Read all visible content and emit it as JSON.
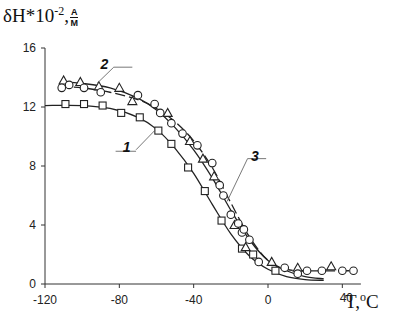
{
  "chart_data": {
    "type": "scatter",
    "title": "",
    "ylabel": "δH*10^-2, A/M",
    "xlabel": "T, °C",
    "ylabel_parts": {
      "main": "δH*10",
      "exp": "-2",
      "sep": ",",
      "num": "A",
      "den": "M"
    },
    "xlabel_parts": {
      "main": "T,",
      "exp": "o",
      "unit": "C"
    },
    "xlim": [
      -120,
      50
    ],
    "ylim": [
      0,
      16
    ],
    "x_ticks": [
      -120,
      -80,
      -40,
      0,
      40
    ],
    "y_ticks": [
      0,
      4,
      8,
      12,
      16
    ],
    "x_tick_labels": [
      "-120",
      "-80",
      "-40",
      "0",
      "40"
    ],
    "y_tick_labels": [
      "0",
      "4",
      "8",
      "12",
      "16"
    ],
    "grid": false,
    "legend": "curve number labels with leader lines",
    "series": [
      {
        "name": "1",
        "marker": "square",
        "line": "solid",
        "points": [
          [
            -109,
            12.2
          ],
          [
            -99,
            12.2
          ],
          [
            -89,
            12.1
          ],
          [
            -79,
            11.6
          ],
          [
            -69,
            11.3
          ],
          [
            -59,
            10.4
          ],
          [
            -52,
            9.5
          ],
          [
            -43,
            7.9
          ],
          [
            -34,
            6.3
          ],
          [
            -25,
            4.3
          ],
          [
            -14,
            2.4
          ],
          [
            -8,
            2.0
          ],
          [
            4,
            0.9
          ]
        ],
        "fit": [
          [
            -120,
            12.1
          ],
          [
            -100,
            12.1
          ],
          [
            -85,
            11.9
          ],
          [
            -70,
            11.3
          ],
          [
            -60,
            10.5
          ],
          [
            -50,
            9.2
          ],
          [
            -40,
            7.5
          ],
          [
            -30,
            5.4
          ],
          [
            -20,
            3.4
          ],
          [
            -10,
            1.9
          ],
          [
            0,
            1.0
          ],
          [
            10,
            0.5
          ],
          [
            20,
            0.3
          ],
          [
            30,
            0.25
          ]
        ]
      },
      {
        "name": "2",
        "marker": "triangle",
        "line": "solid",
        "points": [
          [
            -110,
            13.8
          ],
          [
            -101,
            13.7
          ],
          [
            -91,
            13.4
          ],
          [
            -80,
            13.3
          ],
          [
            -73,
            12.4
          ],
          [
            -54,
            11.6
          ],
          [
            -42,
            9.7
          ],
          [
            -35,
            8.5
          ],
          [
            -29,
            7.3
          ],
          [
            -18,
            4.0
          ],
          [
            -12,
            2.5
          ],
          [
            2,
            1.5
          ],
          [
            16,
            1.1
          ],
          [
            34,
            1.2
          ]
        ],
        "fit": [
          [
            -112,
            13.7
          ],
          [
            -100,
            13.6
          ],
          [
            -85,
            13.3
          ],
          [
            -70,
            12.6
          ],
          [
            -60,
            11.8
          ],
          [
            -50,
            10.6
          ],
          [
            -40,
            9.1
          ],
          [
            -30,
            7.2
          ],
          [
            -20,
            5.0
          ],
          [
            -10,
            3.0
          ],
          [
            0,
            1.6
          ],
          [
            10,
            0.9
          ],
          [
            20,
            0.5
          ],
          [
            30,
            0.35
          ]
        ]
      },
      {
        "name": "3",
        "marker": "circle",
        "line": "dashed",
        "points": [
          [
            -111,
            13.3
          ],
          [
            -107,
            13.5
          ],
          [
            -99,
            13.3
          ],
          [
            -90,
            13.0
          ],
          [
            -70,
            12.8
          ],
          [
            -61,
            12.2
          ],
          [
            -58,
            11.6
          ],
          [
            -52,
            10.9
          ],
          [
            -46,
            10.2
          ],
          [
            -38,
            9.4
          ],
          [
            -30,
            8.2
          ],
          [
            -26,
            6.7
          ],
          [
            -24,
            6.0
          ],
          [
            -20,
            4.7
          ],
          [
            -16,
            4.1
          ],
          [
            -14,
            3.5
          ],
          [
            -13,
            3.7
          ],
          [
            -10,
            3.0
          ],
          [
            -5,
            1.5
          ],
          [
            9,
            1.1
          ],
          [
            16,
            0.7
          ],
          [
            21,
            0.9
          ],
          [
            29,
            0.9
          ],
          [
            40,
            0.9
          ],
          [
            46,
            0.9
          ]
        ],
        "fit": [
          [
            -112,
            13.4
          ],
          [
            -100,
            13.3
          ],
          [
            -85,
            13.0
          ],
          [
            -70,
            12.5
          ],
          [
            -60,
            11.9
          ],
          [
            -50,
            11.0
          ],
          [
            -40,
            9.7
          ],
          [
            -30,
            7.9
          ],
          [
            -20,
            5.5
          ],
          [
            -10,
            3.2
          ],
          [
            0,
            1.6
          ],
          [
            10,
            1.0
          ],
          [
            20,
            0.9
          ],
          [
            45,
            0.9
          ]
        ]
      }
    ],
    "labels": [
      {
        "text": "1",
        "x": -76,
        "y": 9.3
      },
      {
        "text": "2",
        "x": -88,
        "y": 14.9
      },
      {
        "text": "3",
        "x": -7,
        "y": 8.7
      }
    ]
  }
}
